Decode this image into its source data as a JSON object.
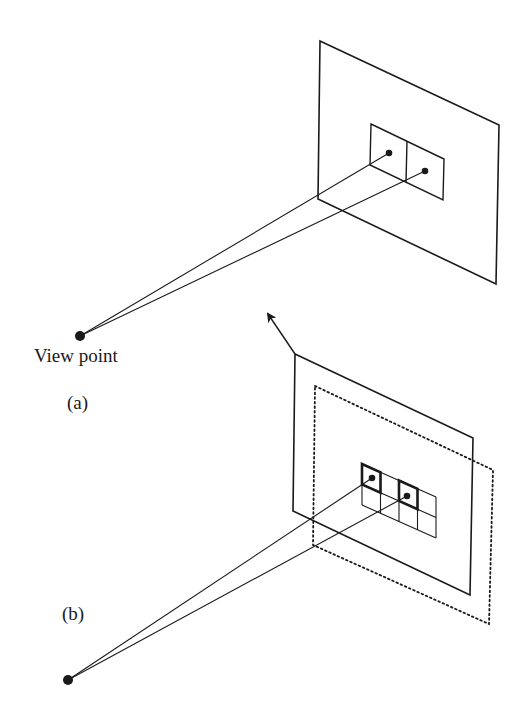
{
  "figure": {
    "ink_color": "#1a1a1a",
    "background": "#ffffff",
    "panels": [
      {
        "id": "a",
        "caption": "(a)",
        "viewpoint_label": "View point",
        "viewpoint": [
          80,
          336
        ],
        "image_plane": {
          "style": "solid",
          "corners": [
            [
              320,
              41
            ],
            [
              499,
              125
            ],
            [
              496,
              284
            ],
            [
              318,
              199
            ]
          ]
        },
        "pixel_window": {
          "corners": [
            [
              371,
              124
            ],
            [
              444,
              159
            ],
            [
              443,
              200
            ],
            [
              370,
              165
            ]
          ],
          "columns": 2,
          "rows": 1,
          "divider": [
            [
              407,
              141
            ],
            [
              406,
              182
            ]
          ]
        },
        "sample_points": [
          [
            389,
            153
          ],
          [
            425,
            171
          ]
        ],
        "rays": [
          {
            "from": [
              80,
              336
            ],
            "to": [
              389,
              153
            ]
          },
          {
            "from": [
              80,
              336
            ],
            "to": [
              425,
              171
            ]
          }
        ]
      },
      {
        "id": "b",
        "caption": "(b)",
        "viewpoint": [
          68,
          680
        ],
        "image_plane": {
          "style": "solid",
          "corners": [
            [
              295,
              354
            ],
            [
              473,
              438
            ],
            [
              470,
              595
            ],
            [
              293,
              511
            ]
          ]
        },
        "shifted_plane": {
          "style": "dotted",
          "corners": [
            [
              315,
              386
            ],
            [
              493,
              470
            ],
            [
              489,
              624
            ],
            [
              313,
              545
            ]
          ]
        },
        "motion_arrow": {
          "from": [
            295,
            354
          ],
          "to": [
            268,
            314
          ]
        },
        "pixel_grid": {
          "corners": [
            [
              362,
              464
            ],
            [
              436,
              497
            ],
            [
              436,
              538
            ],
            [
              362,
              505
            ]
          ],
          "columns": 4,
          "rows": 2,
          "highlighted_cells": [
            [
              0,
              0
            ],
            [
              2,
              0
            ]
          ]
        },
        "sample_points": [
          [
            372,
            478
          ],
          [
            407,
            496
          ]
        ],
        "rays": [
          {
            "from": [
              68,
              680
            ],
            "to": [
              372,
              478
            ]
          },
          {
            "from": [
              68,
              680
            ],
            "to": [
              407,
              496
            ]
          }
        ]
      }
    ]
  }
}
